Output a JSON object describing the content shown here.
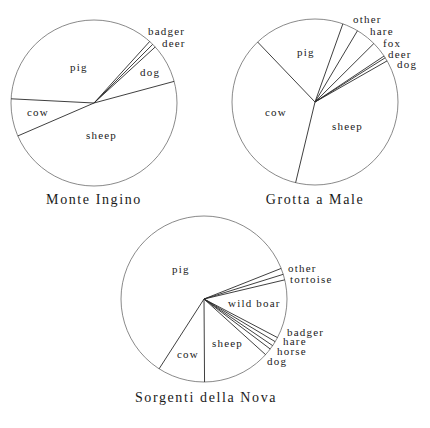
{
  "figure": {
    "titles": [
      "Monte Ingino",
      "Grotta a Male",
      "Sorgenti della Nova"
    ]
  },
  "chart_data": [
    {
      "type": "pie",
      "title": "Monte Ingino",
      "unit": "% (estimated from slice angles)",
      "start_angle_deg": 15.1,
      "direction": "counterclockwise",
      "labels": [
        "dog",
        "deer",
        "badger",
        "pig",
        "cow",
        "sheep"
      ],
      "values": [
        7.6,
        0.7,
        0.8,
        35.9,
        7.3,
        47.7
      ],
      "legend": "none (labels placed on/next to slices)"
    },
    {
      "type": "pie",
      "title": "Grotta a Male",
      "unit": "% (estimated from slice angles)",
      "start_angle_deg": 29.7,
      "direction": "counterclockwise",
      "labels": [
        "dog",
        "deer",
        "fox",
        "hare",
        "other",
        "pig",
        "cow",
        "sheep"
      ],
      "values": [
        0.7,
        0.4,
        3.1,
        4.0,
        3.1,
        17.6,
        34.1,
        37.0
      ],
      "legend": "none (labels placed on/next to slices)"
    },
    {
      "type": "pie",
      "title": "Sorgenti della Nova",
      "unit": "% (estimated from slice angles)",
      "start_angle_deg": 317.9,
      "direction": "counterclockwise",
      "labels": [
        "dog",
        "horse",
        "hare",
        "badger",
        "wild boar",
        "tortoise",
        "other",
        "pig",
        "cow",
        "sheep"
      ],
      "values": [
        1.4,
        0.8,
        0.9,
        0.9,
        11.4,
        1.1,
        1.2,
        59.9,
        9.2,
        13.2
      ],
      "legend": "none (labels placed on/next to slices)"
    }
  ]
}
